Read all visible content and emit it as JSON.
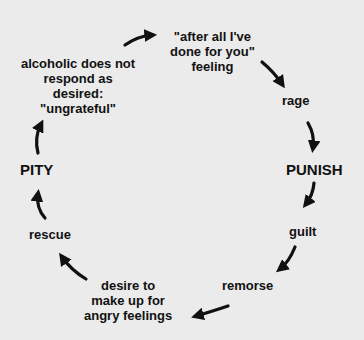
{
  "diagram": {
    "type": "cycle",
    "nodes": [
      {
        "id": "after-all",
        "lines": [
          "\"after all I've",
          "done for you\"",
          "feeling"
        ]
      },
      {
        "id": "rage",
        "lines": [
          "rage"
        ]
      },
      {
        "id": "punish",
        "lines": [
          "PUNISH"
        ]
      },
      {
        "id": "guilt",
        "lines": [
          "guilt"
        ]
      },
      {
        "id": "remorse",
        "lines": [
          "remorse"
        ]
      },
      {
        "id": "desire",
        "lines": [
          "desire to",
          "make up for",
          "angry feelings"
        ]
      },
      {
        "id": "rescue",
        "lines": [
          "rescue"
        ]
      },
      {
        "id": "pity",
        "lines": [
          "PITY"
        ]
      },
      {
        "id": "ungrateful",
        "lines": [
          "alcoholic does not",
          "respond as",
          "desired:",
          "\"ungrateful\""
        ]
      }
    ],
    "edges": [
      [
        "ungrateful",
        "after-all"
      ],
      [
        "after-all",
        "rage"
      ],
      [
        "rage",
        "punish"
      ],
      [
        "punish",
        "guilt"
      ],
      [
        "guilt",
        "remorse"
      ],
      [
        "remorse",
        "desire"
      ],
      [
        "desire",
        "rescue"
      ],
      [
        "rescue",
        "pity"
      ],
      [
        "pity",
        "ungrateful"
      ]
    ]
  },
  "colors": {
    "background": "#ebebeb",
    "ink": "#111111"
  }
}
